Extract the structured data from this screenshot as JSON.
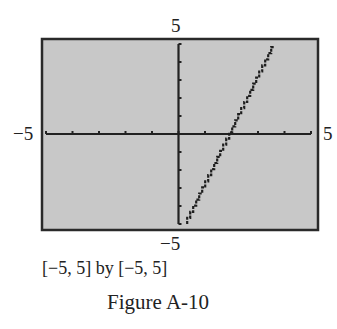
{
  "chart_data": {
    "type": "line",
    "title": "Figure A-10",
    "window_label": "[−5, 5] by [−5, 5]",
    "xlim": [
      -5,
      5
    ],
    "ylim": [
      -5,
      5
    ],
    "x_tick_step": 1,
    "y_tick_step": 1,
    "axis_labels": {
      "x_min": "−5",
      "x_max": "5",
      "y_min": "−5",
      "y_max": "5"
    },
    "grid": false,
    "background": "#c8c8c8",
    "series": [
      {
        "name": "y = 3x − 6",
        "style": "stair-stepped calculator plot",
        "x": [
          0.33,
          1,
          2,
          3,
          3.67
        ],
        "y": [
          -5,
          -3,
          0,
          3,
          5
        ]
      }
    ]
  }
}
